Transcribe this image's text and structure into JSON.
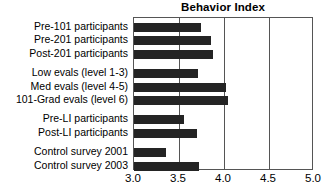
{
  "chart_data": {
    "type": "bar",
    "orientation": "horizontal",
    "title": "Behavior Index",
    "xlabel": "",
    "ylabel": "",
    "xlim": [
      3.0,
      5.0
    ],
    "xticks": [
      "3.0",
      "3.5",
      "4.0",
      "4.5",
      "5.0"
    ],
    "xtick_values": [
      3.0,
      3.5,
      4.0,
      4.5,
      5.0
    ],
    "grid": true,
    "grid_axis": "x",
    "legend": null,
    "bar_color": "#242424",
    "frame_color": "#555555",
    "background": "#ffffff",
    "categories": [
      "Pre-101 participants",
      "Pre-201 participants",
      "Post-201 participants",
      "Low evals (level 1-3)",
      "Med evals (level 4-5)",
      "101-Grad evals (level 6)",
      "Pre-LI participants",
      "Post-LI participants",
      "Control survey 2001",
      "Control survey 2003"
    ],
    "values": [
      3.74,
      3.86,
      3.88,
      3.71,
      4.02,
      4.04,
      3.55,
      3.7,
      3.36,
      3.72
    ],
    "group_breaks_after": [
      2,
      5,
      7
    ],
    "bars": [
      {
        "label": "Pre-101 participants",
        "value": 3.74
      },
      {
        "label": "Pre-201 participants",
        "value": 3.86
      },
      {
        "label": "Post-201 participants",
        "value": 3.88
      },
      {
        "label": "Low evals (level 1-3)",
        "value": 3.71
      },
      {
        "label": "Med evals (level 4-5)",
        "value": 4.02
      },
      {
        "label": "101-Grad evals (level 6)",
        "value": 4.04
      },
      {
        "label": "Pre-LI participants",
        "value": 3.55
      },
      {
        "label": "Post-LI participants",
        "value": 3.7
      },
      {
        "label": "Control survey 2001",
        "value": 3.36
      },
      {
        "label": "Control survey 2003",
        "value": 3.72
      }
    ]
  }
}
